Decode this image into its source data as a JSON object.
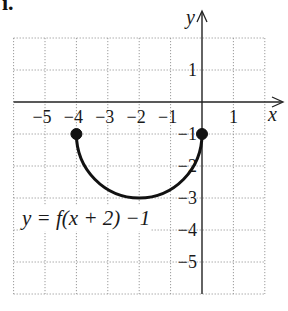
{
  "problem_label": "i.",
  "chart_data": {
    "type": "line",
    "title": "",
    "xlabel": "x",
    "ylabel": "y",
    "xlim": [
      -6,
      2
    ],
    "ylim": [
      -6,
      2
    ],
    "grid": true,
    "grid_style": "dotted",
    "x_ticks": [
      -5,
      -4,
      -3,
      -2,
      -1,
      1
    ],
    "x_tick_labels": [
      "−5",
      "−4",
      "−3",
      "−2",
      "−1",
      "1"
    ],
    "y_ticks": [
      1,
      -1,
      -2,
      -3,
      -4,
      -5
    ],
    "y_tick_labels": [
      "1",
      "−1",
      "−2",
      "−3",
      "−4",
      "−5"
    ],
    "series": [
      {
        "name": "y = f(x + 2) −1",
        "shape": "lower semicircle",
        "center": [
          -2,
          -1
        ],
        "radius": 2,
        "x": [
          -4,
          -3.732,
          -3,
          -2,
          -1,
          -0.268,
          0
        ],
        "y": [
          -1,
          -2,
          -2.732,
          -3,
          -2.732,
          -2,
          -1
        ],
        "endpoints": [
          {
            "x": -4,
            "y": -1,
            "closed": true
          },
          {
            "x": 0,
            "y": -1,
            "closed": true
          }
        ],
        "color": "#111111"
      }
    ],
    "annotations": [
      {
        "text": "y = f(x + 2) −1",
        "x": -5.8,
        "y": -3.8
      }
    ],
    "legend": "none"
  }
}
